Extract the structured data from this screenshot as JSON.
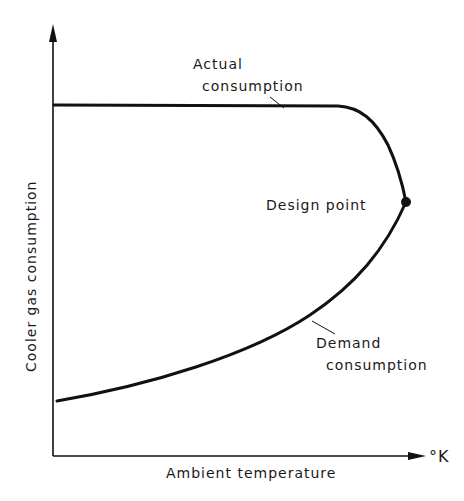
{
  "diagram": {
    "axes": {
      "x_label": "Ambient temperature",
      "x_unit": "°K",
      "y_label": "Cooler gas consumption"
    },
    "curves": [
      {
        "name": "actual",
        "label_line1": "Actual",
        "label_line2": "consumption"
      },
      {
        "name": "demand",
        "label_line1": "Demand",
        "label_line2": "consumption"
      }
    ],
    "design_point": {
      "label": "Design point"
    },
    "colors": {
      "ink": "#111111",
      "background": "#ffffff"
    }
  }
}
